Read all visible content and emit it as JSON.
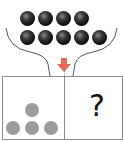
{
  "diagram": {
    "funnel": {
      "black_balls": {
        "top_row_count": 4,
        "bottom_row_count": 5,
        "color": "#111111"
      },
      "arrow": {
        "direction": "down",
        "color": "#e8695a"
      }
    },
    "panels": {
      "left": {
        "gray_dots_count": 4,
        "arrangement": "1 on top, 3 on bottom",
        "color": "#9c9c9c"
      },
      "right": {
        "label": "?"
      }
    },
    "colors": {
      "outline": "#8a8a8a",
      "arrow": "#e8695a",
      "gray_dot": "#9c9c9c"
    }
  }
}
